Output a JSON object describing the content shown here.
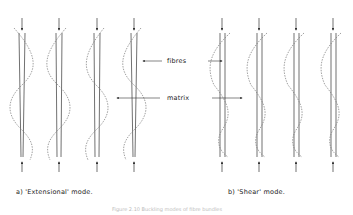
{
  "diagram": {
    "labels": {
      "fibres": "fibres",
      "matrix": "matrix"
    },
    "subcaptions": {
      "a": "a)  'Extensional'  mode.",
      "b": "b)  'Shear'  mode."
    },
    "caption": "Figure 2.10  Buckling modes of fibre bundles",
    "panels": [
      {
        "id": "extensional",
        "pairs_x": [
          [
            19,
            24
          ],
          [
            56,
            62
          ],
          [
            94,
            100
          ],
          [
            131,
            137
          ]
        ],
        "wave_phase": "opposite"
      },
      {
        "id": "shear",
        "pairs_x": [
          [
            220,
            225
          ],
          [
            257,
            262
          ],
          [
            294,
            299
          ],
          [
            331,
            336
          ]
        ],
        "wave_phase": "same"
      }
    ],
    "colors": {
      "line": "#333333",
      "dashed": "#777777"
    }
  }
}
